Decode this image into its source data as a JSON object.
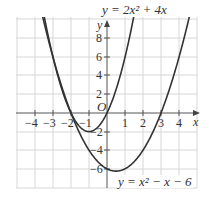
{
  "chart_data": {
    "type": "line",
    "title": "",
    "xlabel": "x",
    "ylabel": "y",
    "xlim": [
      -5,
      5
    ],
    "ylim": [
      -8,
      10
    ],
    "grid": true,
    "x_ticks": [
      -4,
      -3,
      -2,
      -1,
      1,
      2,
      3,
      4
    ],
    "y_ticks": [
      -6,
      -4,
      -2,
      2,
      4,
      6,
      8
    ],
    "origin_label": "O",
    "series": [
      {
        "name": "y = 2x^2 + 4x",
        "label": "y = 2x² + 4x",
        "expression": "2*x*x + 4*x",
        "vertex": [
          -1,
          -2
        ],
        "roots": [
          -2,
          0
        ]
      },
      {
        "name": "y = x^2 - x - 6",
        "label": "y = x² − x − 6",
        "expression": "x*x - x - 6",
        "vertex": [
          0.5,
          -6.25
        ],
        "roots": [
          -2,
          3
        ]
      }
    ],
    "annotations": [
      {
        "text": "y = 2x² + 4x",
        "position": "top"
      },
      {
        "text": "y = x² − x − 6",
        "position": "bottom-right"
      }
    ]
  },
  "labels": {
    "x_axis": "x",
    "y_axis": "y",
    "origin": "O",
    "eq1": "y = 2x² + 4x",
    "eq2": "y = x² − x − 6",
    "xt": {
      "n4": "−4",
      "n3": "−3",
      "n2": "−2",
      "n1": "−1",
      "p1": "1",
      "p2": "2",
      "p3": "3",
      "p4": "4"
    },
    "yt": {
      "p8": "8",
      "p6": "6",
      "p4": "4",
      "p2": "2",
      "n2": "−2",
      "n4": "−4",
      "n6": "−6"
    }
  }
}
